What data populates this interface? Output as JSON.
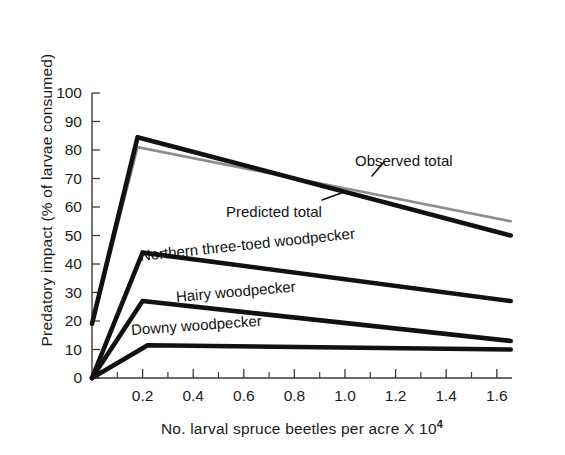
{
  "chart_data": {
    "type": "line",
    "title": "",
    "subtitle": "",
    "xlabel": "No. larval spruce beetles per acre X 10",
    "xlabel_exponent": "4",
    "ylabel": "Predatory impact (% of larvae consumed)",
    "xlim": [
      0,
      1.66
    ],
    "ylim": [
      0,
      100
    ],
    "xticks_major": [
      0.2,
      0.4,
      0.6,
      0.8,
      1.0,
      1.2,
      1.4,
      1.6
    ],
    "xtick_labels": [
      "0.2",
      "0.4",
      "0.6",
      "0.8",
      "1.0",
      "1.2",
      "1.4",
      "1.6"
    ],
    "xticks_minor": [
      0.1,
      0.3,
      0.5,
      0.7,
      0.9,
      1.1,
      1.3,
      1.5
    ],
    "yticks": [
      0,
      10,
      20,
      30,
      40,
      50,
      60,
      70,
      80,
      90,
      100
    ],
    "ytick_labels": [
      "0",
      "10",
      "20",
      "30",
      "40",
      "50",
      "60",
      "70",
      "80",
      "90",
      "100"
    ],
    "grid": false,
    "legend_position": "inline-annotations",
    "series": [
      {
        "name": "Observed total",
        "color": "#111111",
        "width": 4.6,
        "x": [
          0.0,
          0.18,
          1.655
        ],
        "y": [
          19,
          84.5,
          50
        ]
      },
      {
        "name": "Predicted total",
        "color": "#8d8d8d",
        "width": 2.6,
        "x": [
          0.0,
          0.18,
          1.655
        ],
        "y": [
          18.5,
          81,
          55
        ]
      },
      {
        "name": "Northern three-toed woodpecker",
        "color": "#111111",
        "width": 4.6,
        "x": [
          0.0,
          0.2,
          1.655
        ],
        "y": [
          0,
          44,
          27
        ]
      },
      {
        "name": "Hairy woodpecker",
        "color": "#111111",
        "width": 4.6,
        "x": [
          0.0,
          0.2,
          1.655
        ],
        "y": [
          0,
          27,
          13
        ]
      },
      {
        "name": "Downy woodpecker",
        "color": "#111111",
        "width": 4.6,
        "x": [
          0.0,
          0.22,
          1.655
        ],
        "y": [
          0,
          11.5,
          10
        ]
      }
    ],
    "annotations": [
      {
        "text": "Observed total",
        "x_px": 355,
        "y_px": 152,
        "rotation": 0,
        "leader": true
      },
      {
        "text": "Predicted total",
        "x_px": 226,
        "y_px": 203,
        "rotation": 0,
        "leader": true
      },
      {
        "text": "Northern three-toed woodpecker",
        "x_px": 140,
        "y_px": 247,
        "rotation": -6,
        "leader": false
      },
      {
        "text": "Hairy woodpecker",
        "x_px": 176,
        "y_px": 288,
        "rotation": -5,
        "leader": false
      },
      {
        "text": "Downy woodpecker",
        "x_px": 131,
        "y_px": 321,
        "rotation": -4,
        "leader": false
      }
    ]
  }
}
